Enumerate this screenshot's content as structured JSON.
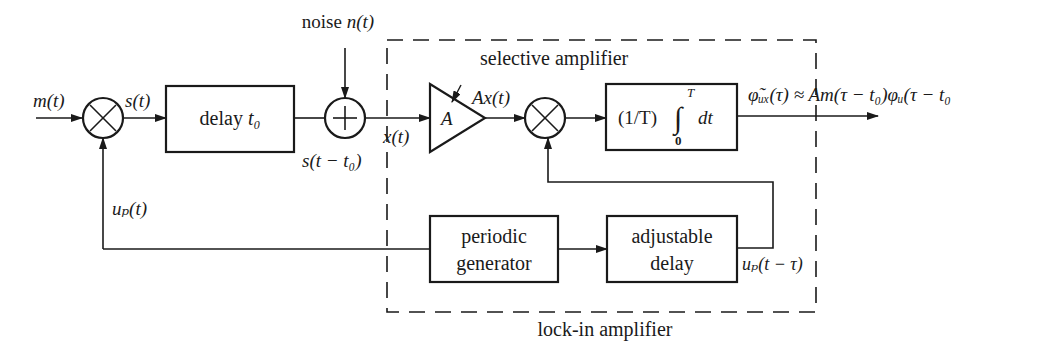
{
  "diagram": {
    "colors": {
      "stroke": "#1a1a1a",
      "background": "#ffffff"
    },
    "inputs": {
      "message": "m(t)",
      "noise_label": "noise",
      "noise_signal": "n(t)"
    },
    "signals": {
      "modulated": "s(t)",
      "delayed": "s(t − t₀)",
      "received": "x(t)",
      "amplified": "Ax(t)",
      "reference": "uₚ(t)",
      "reference_delayed": "uₚ(t − τ)",
      "output": "φ̃ᵤₓ(τ) ≈ Am(τ − t₀)φᵤ(τ − t₀"
    },
    "blocks": {
      "multiplier_1": "×",
      "delay": {
        "label": "delay",
        "param": "t₀"
      },
      "summer": "+",
      "amplifier": {
        "gain": "A",
        "caption": "selective amplifier"
      },
      "multiplier_2": "×",
      "integrator": {
        "prefix": "(1/T)",
        "upper": "T",
        "lower": "0",
        "suffix": "dt"
      },
      "periodic_generator": {
        "line1": "periodic",
        "line2": "generator"
      },
      "adjustable_delay": {
        "line1": "adjustable",
        "line2": "delay"
      }
    },
    "groups": {
      "lock_in": "lock-in amplifier"
    }
  }
}
